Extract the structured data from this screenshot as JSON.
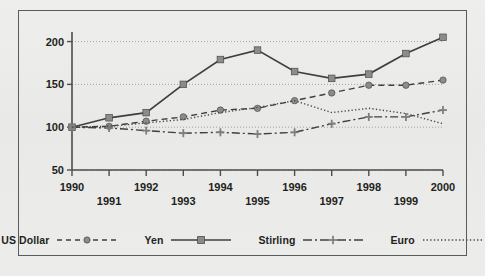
{
  "chart_data": {
    "type": "line",
    "title": "",
    "subtitle": "",
    "xlabel": "",
    "ylabel": "",
    "x": [
      1990,
      1991,
      1992,
      1993,
      1994,
      1995,
      1996,
      1997,
      1998,
      1999,
      2000
    ],
    "xticklabels": [
      "1990",
      "1991",
      "1992",
      "1993",
      "1994",
      "1995",
      "1996",
      "1997",
      "1998",
      "1999",
      "2000"
    ],
    "yticklabels": [
      "50",
      "100",
      "150",
      "200"
    ],
    "yticks": [
      50,
      100,
      150,
      200
    ],
    "ylim": [
      50,
      210
    ],
    "xlim": [
      1989.6,
      2000.4
    ],
    "grid": "horizontal-dotted",
    "legend_position": "bottom",
    "series": [
      {
        "name": "US Dollar",
        "style": "dashed",
        "marker": "circle",
        "color": "#3f3f3f",
        "marker_color": "#8c8c8c",
        "values": [
          100,
          101,
          107,
          112,
          120,
          122,
          131,
          140,
          149,
          149,
          155
        ]
      },
      {
        "name": "Yen",
        "style": "solid",
        "marker": "square",
        "color": "#3f3f3f",
        "marker_color": "#8c8c8c",
        "values": [
          100,
          111,
          117,
          150,
          179,
          190,
          165,
          157,
          162,
          186,
          205
        ]
      },
      {
        "name": "Stirling",
        "style": "dash-dot",
        "marker": "plus",
        "color": "#3f3f3f",
        "marker_color": "#8c8c8c",
        "values": [
          100,
          99,
          96,
          93,
          94,
          92,
          94,
          104,
          112,
          112,
          120
        ]
      },
      {
        "name": "Euro",
        "style": "dotted",
        "marker": "none",
        "color": "#4a4a4a",
        "marker_color": "#8c8c8c",
        "values": [
          100,
          101,
          105,
          109,
          117,
          123,
          131,
          117,
          122,
          116,
          104
        ]
      }
    ]
  },
  "legend": {
    "items": [
      {
        "label": "US Dollar",
        "swatch": "dashed-circle"
      },
      {
        "label": "Yen",
        "swatch": "solid-square"
      },
      {
        "label": "Stirling",
        "swatch": "dashdot-plus"
      },
      {
        "label": "Euro",
        "swatch": "dotted-plain"
      }
    ]
  },
  "colors": {
    "background": "#ebebe9",
    "frame": "#5b5b5b",
    "axis": "#4d4d4d",
    "gridline": "#9a9a9a",
    "text": "#231f20",
    "marker_fill": "#8c8c8c"
  }
}
